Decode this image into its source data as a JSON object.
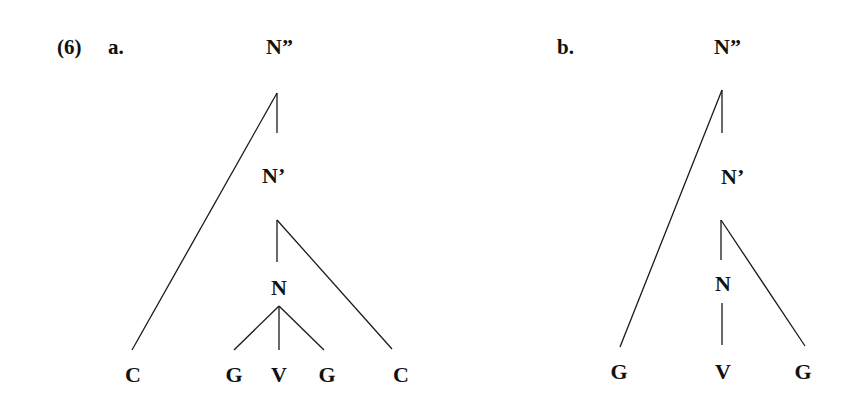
{
  "example_number": "(6)",
  "trees": [
    {
      "id": "a",
      "label": "a.",
      "nodes": {
        "root": "N”",
        "bar": "N’",
        "head": "N",
        "leaves": [
          "C",
          "G",
          "V",
          "G",
          "C"
        ]
      }
    },
    {
      "id": "b",
      "label": "b.",
      "nodes": {
        "root": "N”",
        "bar": "N’",
        "head": "N",
        "leaves": [
          "G",
          "V",
          "G"
        ]
      }
    }
  ],
  "colors": {
    "background": "#ffffff",
    "ink": "#111111"
  }
}
